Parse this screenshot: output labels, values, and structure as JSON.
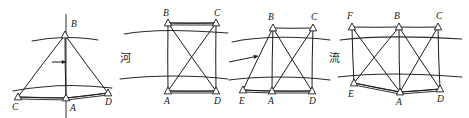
{
  "diagram": {
    "canvas": {
      "width": 469,
      "height": 118,
      "background": "#ffffff"
    },
    "ink_color": "#1c1c1c",
    "annotations": [
      {
        "name": "river-character",
        "text": "河",
        "x": 120,
        "y": 62
      },
      {
        "name": "flow-character",
        "text": "流",
        "x": 329,
        "y": 62
      }
    ],
    "figures": [
      {
        "id": "figure-1",
        "name": "single-triangle-scheme",
        "points": [
          {
            "label": "B",
            "x": 65,
            "y": 35,
            "label_x": 71,
            "label_y": 27
          },
          {
            "label": "C",
            "x": 18,
            "y": 97,
            "label_x": 12,
            "label_y": 110
          },
          {
            "label": "A",
            "x": 66,
            "y": 98,
            "label_x": 70,
            "label_y": 111
          },
          {
            "label": "D",
            "x": 108,
            "y": 93,
            "label_x": 105,
            "label_y": 105
          }
        ],
        "edges": [
          [
            "B",
            "C"
          ],
          [
            "B",
            "D"
          ],
          [
            "B",
            "A"
          ],
          [
            "C",
            "A"
          ],
          [
            "A",
            "D"
          ]
        ],
        "baselines": [
          [
            "C",
            "A"
          ],
          [
            "A",
            "D"
          ]
        ],
        "banks": [
          {
            "name": "upper-bank",
            "path": "M 32 41 C 52 37, 78 36, 98 40"
          },
          {
            "name": "lower-bank",
            "path": "M 13 91 C 45 85, 80 84, 112 88"
          }
        ],
        "axis": {
          "name": "center-axis",
          "x1": 66,
          "y1": 14,
          "x2": 66,
          "y2": 118
        },
        "arrow": {
          "name": "flow-arrow",
          "x1": 52,
          "y1": 62,
          "x2": 66,
          "y2": 62
        }
      },
      {
        "id": "figure-2",
        "name": "quadrilateral-scheme",
        "points": [
          {
            "label": "B",
            "x": 168,
            "y": 23,
            "label_x": 163,
            "label_y": 16
          },
          {
            "label": "C",
            "x": 216,
            "y": 23,
            "label_x": 214,
            "label_y": 16
          },
          {
            "label": "A",
            "x": 168,
            "y": 91,
            "label_x": 164,
            "label_y": 104
          },
          {
            "label": "D",
            "x": 216,
            "y": 91,
            "label_x": 214,
            "label_y": 104
          }
        ],
        "edges": [
          [
            "B",
            "C"
          ],
          [
            "A",
            "D"
          ],
          [
            "B",
            "A"
          ],
          [
            "C",
            "D"
          ],
          [
            "B",
            "D"
          ],
          [
            "C",
            "A"
          ]
        ],
        "baselines": [
          [
            "B",
            "C"
          ],
          [
            "A",
            "D"
          ]
        ],
        "banks": [
          {
            "name": "upper-bank",
            "path": "M 124 34 C 150 29, 190 30, 228 33"
          },
          {
            "name": "lower-bank",
            "path": "M 120 79 C 152 75, 196 75, 228 79"
          }
        ]
      },
      {
        "id": "figure-3",
        "name": "extended-quadrilateral-scheme",
        "points": [
          {
            "label": "B",
            "x": 273,
            "y": 28,
            "label_x": 268,
            "label_y": 20
          },
          {
            "label": "C",
            "x": 313,
            "y": 28,
            "label_x": 311,
            "label_y": 20
          },
          {
            "label": "E",
            "x": 243,
            "y": 90,
            "label_x": 239,
            "label_y": 104
          },
          {
            "label": "A",
            "x": 272,
            "y": 91,
            "label_x": 268,
            "label_y": 104
          },
          {
            "label": "D",
            "x": 312,
            "y": 91,
            "label_x": 309,
            "label_y": 104
          }
        ],
        "edges": [
          [
            "B",
            "C"
          ],
          [
            "B",
            "E"
          ],
          [
            "B",
            "A"
          ],
          [
            "B",
            "D"
          ],
          [
            "C",
            "A"
          ],
          [
            "C",
            "D"
          ],
          [
            "E",
            "A"
          ],
          [
            "A",
            "D"
          ]
        ],
        "baselines": [
          [
            "E",
            "A"
          ],
          [
            "A",
            "D"
          ]
        ],
        "banks": [
          {
            "name": "upper-bank",
            "path": "M 232 42 C 258 36, 300 36, 330 40"
          },
          {
            "name": "lower-bank",
            "path": "M 229 80 C 258 76, 300 76, 330 80"
          }
        ],
        "arrow": {
          "name": "flow-arrow",
          "x1": 229,
          "y1": 62,
          "x2": 258,
          "y2": 56
        }
      },
      {
        "id": "figure-4",
        "name": "double-chain-scheme",
        "points": [
          {
            "label": "F",
            "x": 352,
            "y": 27,
            "label_x": 347,
            "label_y": 19
          },
          {
            "label": "B",
            "x": 399,
            "y": 27,
            "label_x": 394,
            "label_y": 19
          },
          {
            "label": "C",
            "x": 438,
            "y": 27,
            "label_x": 436,
            "label_y": 19
          },
          {
            "label": "E",
            "x": 354,
            "y": 83,
            "label_x": 348,
            "label_y": 97
          },
          {
            "label": "A",
            "x": 400,
            "y": 92,
            "label_x": 396,
            "label_y": 105
          },
          {
            "label": "D",
            "x": 440,
            "y": 89,
            "label_x": 437,
            "label_y": 102
          }
        ],
        "edges": [
          [
            "F",
            "B"
          ],
          [
            "B",
            "C"
          ],
          [
            "F",
            "E"
          ],
          [
            "F",
            "A"
          ],
          [
            "B",
            "E"
          ],
          [
            "B",
            "A"
          ],
          [
            "B",
            "D"
          ],
          [
            "C",
            "A"
          ],
          [
            "C",
            "D"
          ],
          [
            "E",
            "A"
          ],
          [
            "A",
            "D"
          ]
        ],
        "baselines": [
          [
            "E",
            "A"
          ],
          [
            "A",
            "D"
          ]
        ],
        "banks": [
          {
            "name": "upper-bank",
            "path": "M 340 40 C 370 36, 412 36, 462 39"
          },
          {
            "name": "lower-bank",
            "path": "M 338 77 C 370 73, 414 73, 462 77"
          }
        ]
      }
    ]
  }
}
